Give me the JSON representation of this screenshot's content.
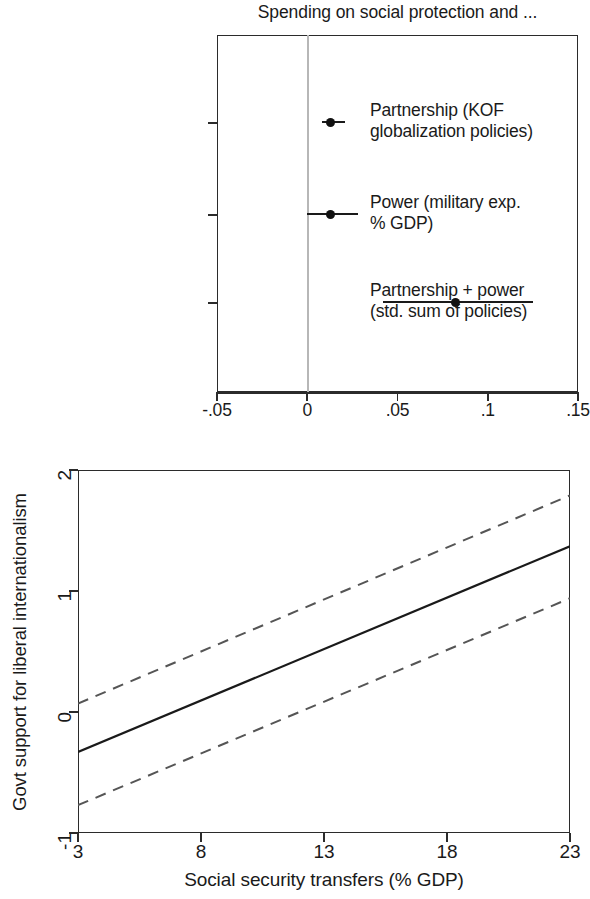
{
  "panel_a": {
    "title": "Spending on social protection and ...",
    "row_labels": [
      [
        "Partnership (KOF",
        "globalization policies)"
      ],
      [
        "Power (military exp.",
        "% GDP)"
      ],
      [
        "Partnership + power",
        "(std. sum of policies)"
      ]
    ],
    "x_tick_labels": [
      "-.05",
      "0",
      ".05",
      ".1",
      ".15"
    ]
  },
  "panel_b": {
    "y_title": "Govt support for liberal internationalism",
    "x_title": "Social security transfers (% GDP)",
    "y_tick_labels": [
      "2",
      "1",
      "0",
      "-1"
    ],
    "x_tick_labels": [
      "3",
      "8",
      "13",
      "18",
      "23"
    ]
  },
  "chart_data": [
    {
      "type": "scatter",
      "subtype": "coefficient-plot",
      "title": "Spending on social protection and ...",
      "xlabel": "",
      "ylabel": "",
      "xlim": [
        -0.05,
        0.15
      ],
      "xticks": [
        -0.05,
        0,
        0.05,
        0.1,
        0.15
      ],
      "xtick_labels": [
        "-.05",
        "0",
        ".05",
        ".1",
        ".15"
      ],
      "grid": false,
      "reference_line_x": 0,
      "legend": "none",
      "categories": [
        "Partnership (KOF globalization policies)",
        "Power (military exp. % GDP)",
        "Partnership + power (std. sum of policies)"
      ],
      "estimates": [
        0.013,
        0.013,
        0.082
      ],
      "ci_low": [
        0.008,
        0.0,
        0.042
      ],
      "ci_high": [
        0.021,
        0.028,
        0.125
      ]
    },
    {
      "type": "line",
      "subtype": "marginal-effects",
      "title": "",
      "xlabel": "Social security transfers (% GDP)",
      "ylabel": "Govt support for liberal internationalism",
      "xlim": [
        3,
        23
      ],
      "ylim": [
        -1,
        2
      ],
      "xticks": [
        3,
        8,
        13,
        18,
        23
      ],
      "yticks": [
        -1,
        0,
        1,
        2
      ],
      "grid": false,
      "legend": "none",
      "x": [
        3,
        23
      ],
      "series": [
        {
          "name": "Predicted value",
          "style": "solid",
          "values": [
            -0.33,
            1.37
          ]
        },
        {
          "name": "Upper 95% CI",
          "style": "dashed",
          "values": [
            0.07,
            1.79
          ]
        },
        {
          "name": "Lower 95% CI",
          "style": "dashed",
          "values": [
            -0.77,
            0.94
          ]
        }
      ]
    }
  ]
}
